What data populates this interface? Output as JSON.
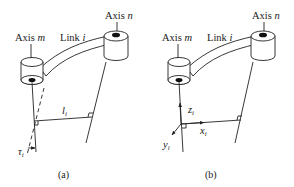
{
  "panels": [
    {
      "id": "a",
      "caption": "(a)",
      "labels": {
        "axis_m_prefix": "Axis ",
        "axis_m_var": "m",
        "axis_n_prefix": "Axis ",
        "axis_n_var": "n",
        "link_prefix": "Link ",
        "link_var": "i",
        "length_var": "l",
        "length_sub": "i",
        "twist_var": "τ",
        "twist_sub": "i"
      }
    },
    {
      "id": "b",
      "caption": "(b)",
      "labels": {
        "axis_m_prefix": "Axis ",
        "axis_m_var": "m",
        "axis_n_prefix": "Axis ",
        "axis_n_var": "n",
        "link_prefix": "Link ",
        "link_var": "i",
        "z_var": "z",
        "z_sub": "i",
        "x_var": "x",
        "x_sub": "i",
        "y_var": "y",
        "y_sub": "i"
      }
    }
  ],
  "colors": {
    "stroke": "#222222",
    "background": "#ffffff"
  }
}
